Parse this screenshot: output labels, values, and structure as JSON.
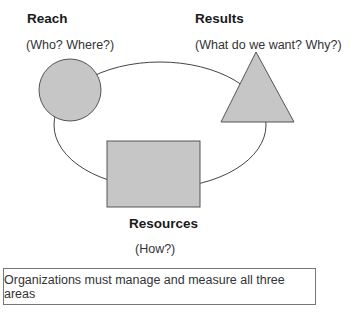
{
  "diagram": {
    "reach": {
      "title": "Reach",
      "subtitle": "(Who? Where?)",
      "shape": "circle"
    },
    "results": {
      "title": "Results",
      "subtitle": "(What do we want? Why?)",
      "shape": "triangle"
    },
    "resources": {
      "title": "Resources",
      "subtitle": "(How?)",
      "shape": "rectangle"
    },
    "connector": "ellipse",
    "colors": {
      "shape_fill": "#c6c6c6",
      "shape_stroke": "#555555",
      "line": "#444444"
    }
  },
  "note": {
    "text": "Organizations must manage and measure all three areas"
  }
}
